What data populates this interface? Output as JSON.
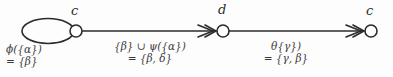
{
  "diagram": {
    "background_color": "#fdfdfd",
    "stroke_color": "#2b2b2b",
    "nodes": [
      {
        "id": "n1",
        "label": "c",
        "cx": 76,
        "cy": 31,
        "r": 6,
        "self_loop": true
      },
      {
        "id": "n2",
        "label": "d",
        "cx": 223,
        "cy": 31,
        "r": 6,
        "self_loop": false
      },
      {
        "id": "n3",
        "label": "c",
        "cx": 371,
        "cy": 31,
        "r": 6,
        "self_loop": false
      }
    ],
    "edges": [
      {
        "id": "e1",
        "from": "n1",
        "to": "n2",
        "arrowhead": "double-chevron",
        "label_line1": "{β} ∪ ψ({α})",
        "label_line2": "= {β, δ}"
      },
      {
        "id": "e2",
        "from": "n2",
        "to": "n3",
        "arrowhead": "double-chevron",
        "label_line1": "θ{γ})",
        "label_line2": "= {γ, β}"
      }
    ],
    "self_loop_label": {
      "line1": "ϕ({α})",
      "line2": "= {β}"
    }
  }
}
